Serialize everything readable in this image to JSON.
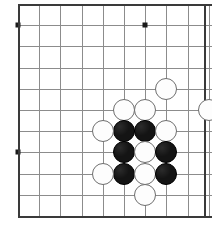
{
  "app": {
    "title": "Go Board Position",
    "board_type": "go-board",
    "view": "partial-board-corner-crop"
  },
  "board": {
    "grid_origin_x": 18,
    "grid_origin_y": 4,
    "spacing": 21.2,
    "columns": 10,
    "rows": 11,
    "line_color": "#8c8c8c",
    "edge_color": "#3a3a3a",
    "background_color": "#ffffff",
    "stone_radius": 11,
    "star_points": [
      {
        "col": 0,
        "row": 1,
        "label": "star-point-upper-left"
      },
      {
        "col": 6,
        "row": 1,
        "label": "star-point-upper-right"
      },
      {
        "col": 0,
        "row": 7,
        "label": "star-point-lower-left"
      }
    ],
    "edges": [
      {
        "side": "top",
        "label": "board-edge-top"
      },
      {
        "side": "left",
        "label": "board-edge-left"
      },
      {
        "side": "right",
        "label": "board-edge-right"
      },
      {
        "side": "bottom",
        "label": "board-edge-bottom"
      }
    ]
  },
  "stones": [
    {
      "id": "w1",
      "color": "white",
      "col": 7,
      "row": 4,
      "label": "white-stone-h5"
    },
    {
      "id": "w2",
      "color": "white",
      "col": 9,
      "row": 5,
      "label": "white-stone-j6"
    },
    {
      "id": "w3",
      "color": "white",
      "col": 5,
      "row": 5,
      "label": "white-stone-f6"
    },
    {
      "id": "w4",
      "color": "white",
      "col": 6,
      "row": 5,
      "label": "white-stone-g6"
    },
    {
      "id": "b1",
      "color": "black",
      "col": 5,
      "row": 6,
      "label": "black-stone-f7"
    },
    {
      "id": "b2",
      "color": "black",
      "col": 6,
      "row": 6,
      "label": "black-stone-g7"
    },
    {
      "id": "w5",
      "color": "white",
      "col": 7,
      "row": 6,
      "label": "white-stone-h7"
    },
    {
      "id": "b3",
      "color": "black",
      "col": 5,
      "row": 7,
      "label": "black-stone-f8"
    },
    {
      "id": "w6",
      "color": "white",
      "col": 6,
      "row": 7,
      "label": "white-stone-g8"
    },
    {
      "id": "b4",
      "color": "black",
      "col": 7,
      "row": 7,
      "label": "black-stone-h8"
    },
    {
      "id": "b5",
      "color": "black",
      "col": 5,
      "row": 8,
      "label": "black-stone-f9"
    },
    {
      "id": "w7",
      "color": "white",
      "col": 6,
      "row": 8,
      "label": "white-stone-g9"
    },
    {
      "id": "b6",
      "color": "black",
      "col": 7,
      "row": 8,
      "label": "black-stone-h9"
    },
    {
      "id": "w8",
      "color": "white",
      "col": 6,
      "row": 9,
      "label": "white-stone-g10"
    },
    {
      "id": "w9",
      "color": "white",
      "col": 4,
      "row": 6,
      "label": "white-stone-e7"
    },
    {
      "id": "w10",
      "color": "white",
      "col": 4,
      "row": 8,
      "label": "white-stone-e9"
    }
  ],
  "counts": {
    "black_stones": 6,
    "white_stones": 10,
    "total_stones": 16
  }
}
